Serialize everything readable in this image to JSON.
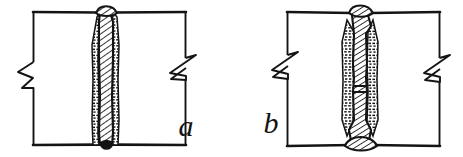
{
  "figure": {
    "style": "vintage line engraving",
    "background_color": "#ffffff",
    "ink_color": "#141414",
    "panels": [
      {
        "id": "panel-a",
        "label": "a",
        "label_position": "bottom-right",
        "description": "Single-vee butt weld between two plates, weld bead hatched, heat-affected zones stippled, plate ends shown with zigzag break lines",
        "weld_type": "single-vee butt weld",
        "reinforcement": "top crown only"
      },
      {
        "id": "panel-b",
        "label": "b",
        "label_position": "bottom-left",
        "description": "Double-vee butt weld between two plates with reinforcement crowns top and bottom, weld bead hatched, plate ends shown with zigzag break lines",
        "weld_type": "double-vee butt weld",
        "reinforcement": "top and bottom crowns"
      }
    ],
    "elements": {
      "plate_outline": "plate-outline",
      "weld_bead": "weld-bead-hatched",
      "fusion_zone": "fusion-zone-stippled",
      "break_symbol": "zigzag-break-line"
    }
  }
}
